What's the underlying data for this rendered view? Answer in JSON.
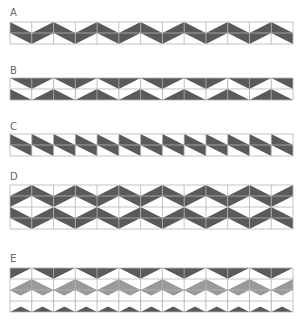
{
  "colors": {
    "dark": "#5a5a5a",
    "medium": "#9a9a9a",
    "light": "#ffffff",
    "grid": "#b4b4b4"
  },
  "grid": {
    "x": 10,
    "width": 283,
    "columns": 13,
    "row_height": 11
  },
  "panels": [
    {
      "id": "A",
      "label": "A",
      "label_y": 8,
      "top": 22,
      "rows": 2,
      "style": "zigzag-dark"
    },
    {
      "id": "B",
      "label": "B",
      "label_y": 66,
      "top": 78,
      "rows": 2,
      "style": "zigzag-inverse"
    },
    {
      "id": "C",
      "label": "C",
      "label_y": 122,
      "top": 134,
      "rows": 2,
      "style": "diagonal-bands"
    },
    {
      "id": "D",
      "label": "D",
      "label_y": 172,
      "top": 185,
      "rows": 4,
      "style": "diamond-dark"
    },
    {
      "id": "E",
      "label": "E",
      "label_y": 254,
      "top": 268,
      "rows": 4,
      "style": "diamond-inverse"
    }
  ]
}
